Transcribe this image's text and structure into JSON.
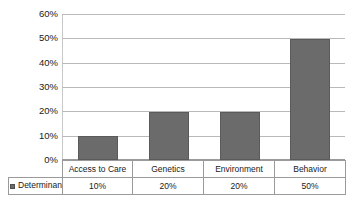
{
  "chart_data": {
    "type": "bar",
    "title": "",
    "xlabel": "",
    "ylabel": "",
    "categories": [
      "Access to Care",
      "Genetics",
      "Environment",
      "Behavior"
    ],
    "values": [
      10,
      20,
      20,
      50
    ],
    "value_labels": [
      "10%",
      "20%",
      "20%",
      "50%"
    ],
    "series": [
      {
        "name": "Determinants",
        "values": [
          10,
          20,
          20,
          50
        ],
        "value_labels": [
          "10%",
          "20%",
          "20%",
          "50%"
        ],
        "color": "#6b6b6b"
      }
    ],
    "ylim": [
      0,
      60
    ],
    "ytick_values": [
      60,
      50,
      40,
      30,
      20,
      10,
      0
    ],
    "ytick_labels": [
      "60%",
      "50%",
      "40%",
      "30%",
      "20%",
      "10%",
      "0%"
    ],
    "grid": true,
    "legend_position": "data-table-row-header",
    "data_table_visible": true
  },
  "legend": {
    "marker_label": "Determinants",
    "marker_color": "#6b6b6b"
  },
  "colors": {
    "bar_fill": "#6b6b6b",
    "bar_stroke": "#5a5a5a",
    "gridline": "#b9b9b9",
    "table_border": "#9a9a9a",
    "text": "#1a1a1a",
    "background": "#ffffff"
  }
}
